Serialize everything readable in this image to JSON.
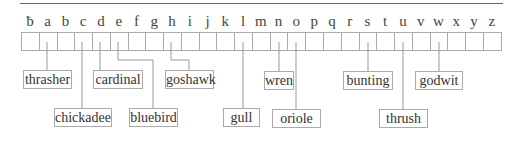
{
  "diagram": {
    "letters": [
      "ƀ",
      "a",
      "b",
      "c",
      "d",
      "e",
      "f",
      "g",
      "h",
      "i",
      "j",
      "k",
      "l",
      "m",
      "n",
      "o",
      "p",
      "q",
      "r",
      "s",
      "t",
      "u",
      "v",
      "w",
      "x",
      "y",
      "z"
    ],
    "labels": [
      {
        "text": "thrasher",
        "letter": "a",
        "left": 23,
        "top": 70,
        "width": 49
      },
      {
        "text": "chickadee",
        "letter": "c",
        "left": 54,
        "top": 108,
        "width": 58
      },
      {
        "text": "cardinal",
        "letter": "d",
        "left": 93,
        "top": 70,
        "width": 50
      },
      {
        "text": "bluebird",
        "letter": "e",
        "left": 129,
        "top": 108,
        "width": 49
      },
      {
        "text": "goshawk",
        "letter": "h",
        "left": 165,
        "top": 70,
        "width": 49
      },
      {
        "text": "gull",
        "letter": "l",
        "left": 223,
        "top": 108,
        "width": 37
      },
      {
        "text": "wren",
        "letter": "n",
        "left": 264,
        "top": 71,
        "width": 30
      },
      {
        "text": "oriole",
        "letter": "o",
        "left": 272,
        "top": 109,
        "width": 49
      },
      {
        "text": "bunting",
        "letter": "s",
        "left": 343,
        "top": 71,
        "width": 50
      },
      {
        "text": "thrush",
        "letter": "u",
        "left": 379,
        "top": 109,
        "width": 49
      },
      {
        "text": "godwit",
        "letter": "w",
        "left": 415,
        "top": 71,
        "width": 48
      }
    ]
  }
}
